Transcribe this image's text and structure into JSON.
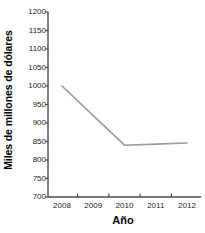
{
  "chart_data": {
    "type": "line",
    "title": "",
    "xlabel": "Año",
    "ylabel": "Miles de millones de dólares",
    "categories": [
      "2008",
      "2009",
      "2010",
      "2011",
      "2012"
    ],
    "x": [
      2008,
      2009,
      2010,
      2011,
      2012
    ],
    "values": [
      1000,
      920,
      840,
      843,
      846
    ],
    "series": [
      {
        "name": "",
        "values": [
          1000,
          920,
          840,
          843,
          846
        ]
      }
    ],
    "ylim": [
      700,
      1200
    ],
    "yticks": [
      700,
      750,
      800,
      850,
      900,
      950,
      1000,
      1050,
      1100,
      1150,
      1200
    ],
    "ytick_labels": [
      "700",
      "750",
      "800",
      "850",
      "900",
      "950",
      "1000",
      "1050",
      "1100",
      "1150",
      "1200"
    ],
    "xtick_labels": [
      "2008",
      "2009",
      "2010",
      "2011",
      "2012"
    ],
    "grid": false,
    "legend": null,
    "line_color": "#9a9a9a",
    "axis_color": "#4d4d4d",
    "text_color": "#1a1a1a",
    "background": "#ffffff"
  }
}
